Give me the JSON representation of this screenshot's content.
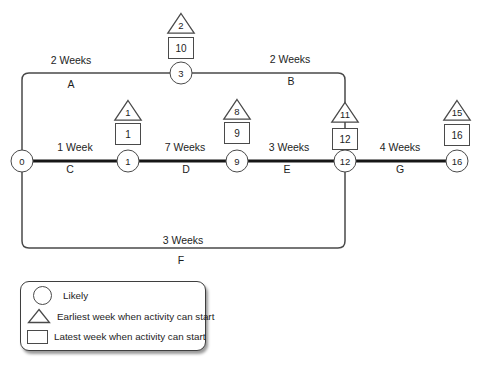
{
  "colors": {
    "line": "#4a4a4a",
    "critical_path": "#161616",
    "background": "#ffffff",
    "text": "#1d1d1d"
  },
  "diagram": {
    "type": "activity-network-pert",
    "nodes": {
      "n0": "0",
      "n1": "1",
      "n3": "3",
      "n9": "9",
      "n12": "12",
      "n16": "16"
    },
    "markers": {
      "n3": {
        "earliest": "2",
        "latest": "10"
      },
      "n1": {
        "earliest": "1",
        "latest": "1"
      },
      "n9": {
        "earliest": "8",
        "latest": "9"
      },
      "n12": {
        "earliest": "11",
        "latest": "12"
      },
      "n16": {
        "earliest": "15",
        "latest": "16"
      }
    },
    "activities": {
      "A": {
        "name": "A",
        "duration": "2 Weeks",
        "from": "0",
        "to": "3"
      },
      "B": {
        "name": "B",
        "duration": "2 Weeks",
        "from": "3",
        "to": "12"
      },
      "C": {
        "name": "C",
        "duration": "1 Week",
        "from": "0",
        "to": "1"
      },
      "D": {
        "name": "D",
        "duration": "7 Weeks",
        "from": "1",
        "to": "9"
      },
      "E": {
        "name": "E",
        "duration": "3 Weeks",
        "from": "9",
        "to": "12"
      },
      "F": {
        "name": "F",
        "duration": "3 Weeks",
        "from": "0",
        "to": "12"
      },
      "G": {
        "name": "G",
        "duration": "4 Weeks",
        "from": "12",
        "to": "16"
      }
    }
  },
  "legend": {
    "items": [
      {
        "icon": "circle",
        "label": "Likely"
      },
      {
        "icon": "triangle",
        "label": "Earliest week when activity can start"
      },
      {
        "icon": "square",
        "label": "Latest week when activity can start"
      }
    ]
  }
}
